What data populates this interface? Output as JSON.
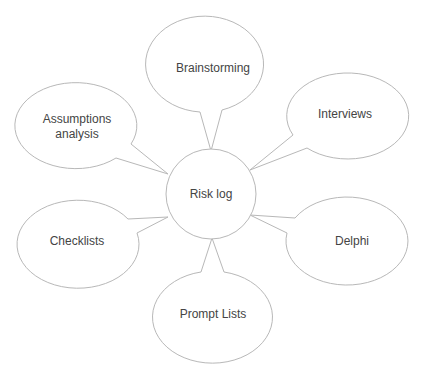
{
  "diagram": {
    "type": "mind-map",
    "center": {
      "label": "Risk log"
    },
    "nodes": [
      {
        "id": "brainstorming",
        "label": "Brainstorming"
      },
      {
        "id": "assumptions",
        "label_lines": [
          "Assumptions",
          "analysis"
        ]
      },
      {
        "id": "interviews",
        "label": "Interviews"
      },
      {
        "id": "checklists",
        "label": "Checklists"
      },
      {
        "id": "delphi",
        "label": "Delphi"
      },
      {
        "id": "prompt-lists",
        "label": "Prompt Lists"
      }
    ],
    "colors": {
      "stroke": "#b8b8b8",
      "text": "#444444",
      "background": "#ffffff"
    }
  }
}
